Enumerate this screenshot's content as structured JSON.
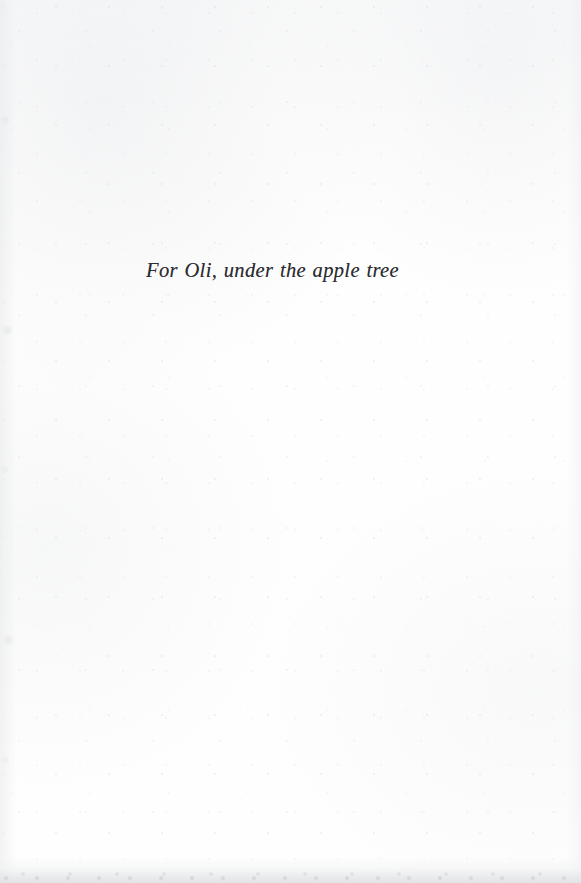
{
  "page": {
    "kind": "book-dedication-page",
    "background_color": "#fefefe",
    "ink_color": "#2c2c31",
    "edge_tone_color": "#e5e7e9"
  },
  "dedication": {
    "text": "For Oli, under the apple tree"
  }
}
